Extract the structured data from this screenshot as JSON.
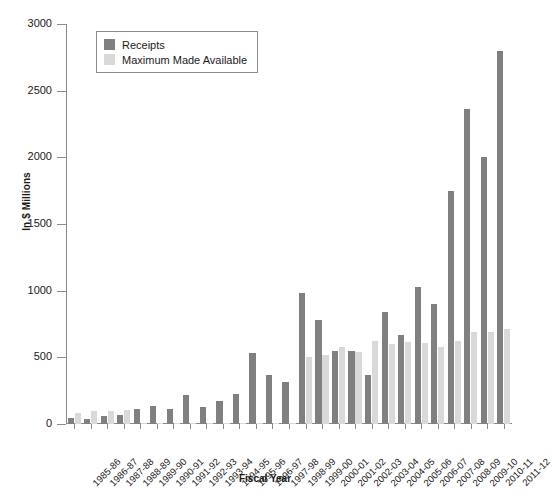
{
  "chart_data": {
    "type": "bar",
    "title": "",
    "xlabel": "Fiscal Year",
    "ylabel": "In $ Millions",
    "ylim": [
      0,
      3000
    ],
    "yticks": [
      0,
      500,
      1000,
      1500,
      2000,
      2500,
      3000
    ],
    "grid": false,
    "legend_position": "top-left",
    "categories": [
      "1985-86",
      "1986-87",
      "1987-88",
      "1988-89",
      "1989-90",
      "1990-91",
      "1991-92",
      "1992-93",
      "1993-94",
      "1994-95",
      "1995-96",
      "1996-97",
      "1997-98",
      "1998-99",
      "1999-00",
      "2000-01",
      "2001-02",
      "2002-03",
      "2003-04",
      "2004-05",
      "2005-06",
      "2006-07",
      "2007-08",
      "2008-09",
      "2009-10",
      "2010-11",
      "2011-12"
    ],
    "series": [
      {
        "name": "Receipts",
        "color": "#808080",
        "values": [
          45,
          38,
          60,
          70,
          115,
          135,
          110,
          215,
          130,
          175,
          225,
          535,
          365,
          315,
          985,
          780,
          545,
          545,
          365,
          840,
          665,
          1025,
          900,
          1750,
          2365,
          2000,
          2800
        ]
      },
      {
        "name": "Maximum Made Available",
        "color": "#d9d9d9",
        "values": [
          80,
          95,
          100,
          105,
          10,
          10,
          10,
          10,
          10,
          10,
          10,
          10,
          10,
          10,
          500,
          520,
          575,
          540,
          625,
          600,
          615,
          610,
          580,
          625,
          690,
          690,
          710
        ]
      }
    ]
  },
  "legend": {
    "items": [
      {
        "label": "Receipts"
      },
      {
        "label": "Maximum Made Available"
      }
    ]
  },
  "axes": {
    "y_title": "In $ Millions",
    "x_title": "Fiscal Year"
  }
}
